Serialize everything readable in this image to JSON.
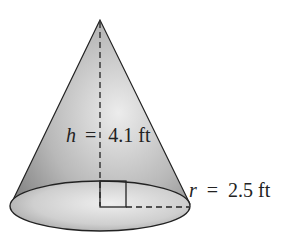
{
  "diagram": {
    "shape": "right circular cone",
    "height_label": {
      "var": "h",
      "eq": "=",
      "value": "4.1 ft"
    },
    "radius_label": {
      "var": "r",
      "eq": "=",
      "value": "2.5 ft"
    },
    "colors": {
      "fill_dark": "#8a8a8a",
      "fill_light": "#e6e6e6",
      "stroke": "#222222"
    }
  }
}
